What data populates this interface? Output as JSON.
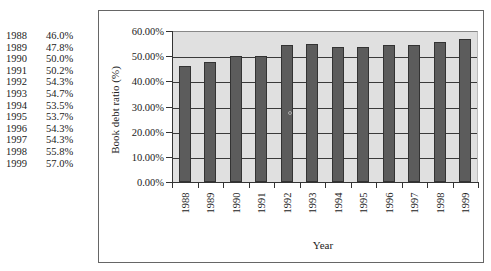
{
  "table": {
    "rows": [
      {
        "year": "1988",
        "value": "46.0%"
      },
      {
        "year": "1989",
        "value": "47.8%"
      },
      {
        "year": "1990",
        "value": "50.0%"
      },
      {
        "year": "1991",
        "value": "50.2%"
      },
      {
        "year": "1992",
        "value": "54.3%"
      },
      {
        "year": "1993",
        "value": "54.7%"
      },
      {
        "year": "1994",
        "value": "53.5%"
      },
      {
        "year": "1995",
        "value": "53.7%"
      },
      {
        "year": "1996",
        "value": "54.3%"
      },
      {
        "year": "1997",
        "value": "54.3%"
      },
      {
        "year": "1998",
        "value": "55.8%"
      },
      {
        "year": "1999",
        "value": "57.0%"
      }
    ]
  },
  "colors": {
    "bar": "#5c5c5c",
    "plot_background": "#e0e0e0",
    "gridline": "#3a3a3a"
  },
  "chart_data": {
    "type": "bar",
    "title": "",
    "xlabel": "Year",
    "ylabel": "Book debt ratio (%)",
    "categories": [
      "1988",
      "1989",
      "1990",
      "1991",
      "1992",
      "1993",
      "1994",
      "1995",
      "1996",
      "1997",
      "1998",
      "1999"
    ],
    "values": [
      46.0,
      47.8,
      50.0,
      50.2,
      54.3,
      54.7,
      53.5,
      53.7,
      54.3,
      54.3,
      55.8,
      57.0
    ],
    "ylim": [
      0,
      60
    ],
    "yticks": [
      "0.00%",
      "10.00%",
      "20.00%",
      "30.00%",
      "40.00%",
      "50.00%",
      "60.00%"
    ],
    "ytick_values": [
      0,
      10,
      20,
      30,
      40,
      50,
      60
    ],
    "grid": true,
    "legend": null,
    "x_tick_label_rotation": 90
  }
}
